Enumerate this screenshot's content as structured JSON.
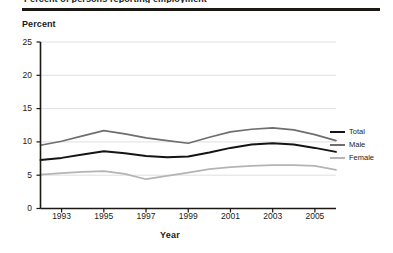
{
  "figure": {
    "clipped_header": "Percent of persons reporting employment",
    "y_axis_title": "Percent",
    "x_axis_title": "Year"
  },
  "legend": {
    "position": "right",
    "entries": [
      {
        "label": "Total",
        "color": "#141414"
      },
      {
        "label": "Male",
        "color": "#6e6e6e"
      },
      {
        "label": "Female",
        "color": "#b4b4b4"
      }
    ]
  },
  "colors": {
    "total": "#141414",
    "male": "#6e6e6e",
    "female": "#b4b4b4",
    "axis": "#1c1814",
    "grid": "#d8d8d8",
    "background": "#ffffff"
  },
  "chart_data": {
    "type": "line",
    "title": "Percent of persons reporting employment",
    "xlabel": "Year",
    "ylabel": "Percent",
    "xlim": [
      1992,
      2006
    ],
    "ylim": [
      0,
      25
    ],
    "yticks": [
      0,
      5,
      10,
      15,
      20,
      25
    ],
    "xticks": [
      1993,
      1995,
      1997,
      1999,
      2001,
      2003,
      2005
    ],
    "grid": "horizontal",
    "legend_position": "right",
    "x": [
      1992,
      1993,
      1994,
      1995,
      1996,
      1997,
      1998,
      1999,
      2000,
      2001,
      2002,
      2003,
      2004,
      2005,
      2006
    ],
    "series": [
      {
        "name": "Total",
        "color": "#141414",
        "values": [
          7.3,
          7.6,
          8.1,
          8.6,
          8.3,
          7.9,
          7.7,
          7.8,
          8.4,
          9.1,
          9.6,
          9.8,
          9.6,
          9.1,
          8.5
        ]
      },
      {
        "name": "Male",
        "color": "#6e6e6e",
        "values": [
          9.5,
          10.1,
          10.9,
          11.7,
          11.2,
          10.6,
          10.2,
          9.8,
          10.7,
          11.5,
          11.9,
          12.1,
          11.8,
          11.1,
          10.2
        ]
      },
      {
        "name": "Female",
        "color": "#b4b4b4",
        "values": [
          5.1,
          5.3,
          5.5,
          5.6,
          5.2,
          4.4,
          4.9,
          5.4,
          5.9,
          6.2,
          6.4,
          6.5,
          6.5,
          6.4,
          5.8
        ]
      }
    ]
  }
}
